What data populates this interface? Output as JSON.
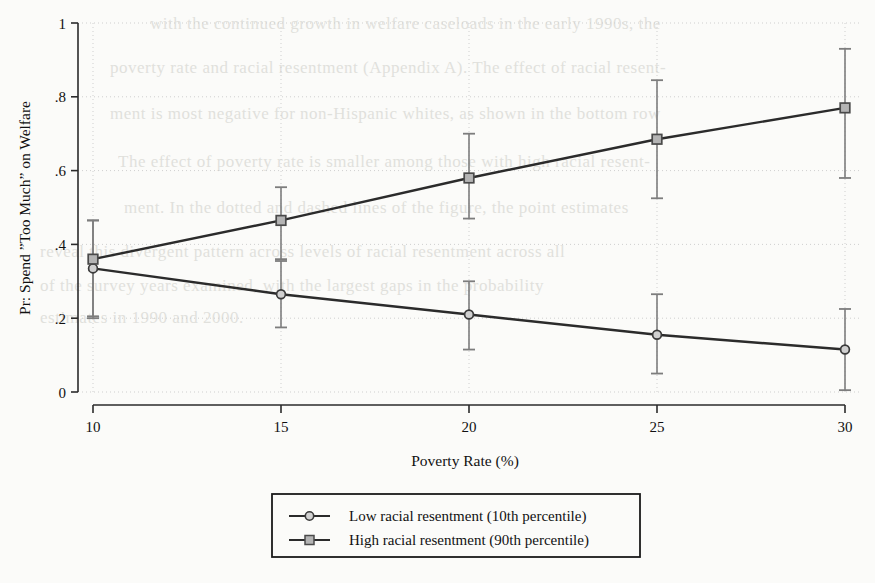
{
  "page": {
    "background_color": "#fbfbf9",
    "showthrough_lines": [
      {
        "text": "with the continued growth in welfare caseloads in the early 1990s, the",
        "x": 150,
        "y": 14,
        "size": 17
      },
      {
        "text": "poverty rate and racial resentment (Appendix A). The effect of racial resent-",
        "x": 110,
        "y": 58,
        "size": 17
      },
      {
        "text": "ment is most negative for non-Hispanic whites, as shown in the bottom row",
        "x": 110,
        "y": 104,
        "size": 17
      },
      {
        "text": "The effect of poverty rate is smaller among those with high racial resent-",
        "x": 118,
        "y": 152,
        "size": 17
      },
      {
        "text": "ment. In the dotted and dashed lines of the figure, the point estimates",
        "x": 124,
        "y": 198,
        "size": 17
      },
      {
        "text": "reveal this divergent pattern across levels of racial resentment across all",
        "x": 40,
        "y": 242,
        "size": 17
      },
      {
        "text": "of the survey years examined, with the largest gaps in the probability",
        "x": 40,
        "y": 276,
        "size": 17
      },
      {
        "text": "estimates in 1990 and 2000.",
        "x": 40,
        "y": 308,
        "size": 17
      }
    ]
  },
  "chart_data": {
    "type": "line",
    "title": "",
    "xlabel": "Poverty Rate (%)",
    "ylabel": "Pr: Spend ”Too Much” on Welfare",
    "x": [
      10,
      15,
      20,
      25,
      30
    ],
    "xtick_labels": [
      "10",
      "15",
      "20",
      "25",
      "30"
    ],
    "ytick_labels": [
      "0",
      ".2",
      ".4",
      ".6",
      ".8",
      "1"
    ],
    "ytick_values": [
      0,
      0.2,
      0.4,
      0.6,
      0.8,
      1
    ],
    "xlim": [
      10,
      30
    ],
    "ylim": [
      0,
      1
    ],
    "grid": true,
    "grid_style": "dotted",
    "legend_position": "below",
    "series": [
      {
        "name": "Low racial resentment (10th percentile)",
        "marker": "circle",
        "values": [
          0.335,
          0.265,
          0.21,
          0.155,
          0.115
        ],
        "ci_low": [
          0.205,
          0.175,
          0.115,
          0.05,
          0.005
        ],
        "ci_high": [
          0.465,
          0.355,
          0.3,
          0.265,
          0.225
        ]
      },
      {
        "name": "High racial resentment (90th percentile)",
        "marker": "square",
        "values": [
          0.36,
          0.465,
          0.58,
          0.685,
          0.77
        ],
        "ci_low": [
          0.2,
          0.36,
          0.47,
          0.525,
          0.58
        ],
        "ci_high": [
          0.465,
          0.555,
          0.7,
          0.845,
          0.93
        ]
      }
    ],
    "colors": {
      "line": "#2b2b2b",
      "error_bar": "#7d7d7d",
      "marker_fill": "#b4b4b4",
      "marker_edge": "#4a4a4a",
      "grid": "#cfcfcf",
      "axis": "#2b2b2b"
    }
  },
  "legend": {
    "items": [
      {
        "label": "Low racial resentment (10th percentile)",
        "marker": "circle"
      },
      {
        "label": "High racial resentment (90th percentile)",
        "marker": "square"
      }
    ]
  }
}
